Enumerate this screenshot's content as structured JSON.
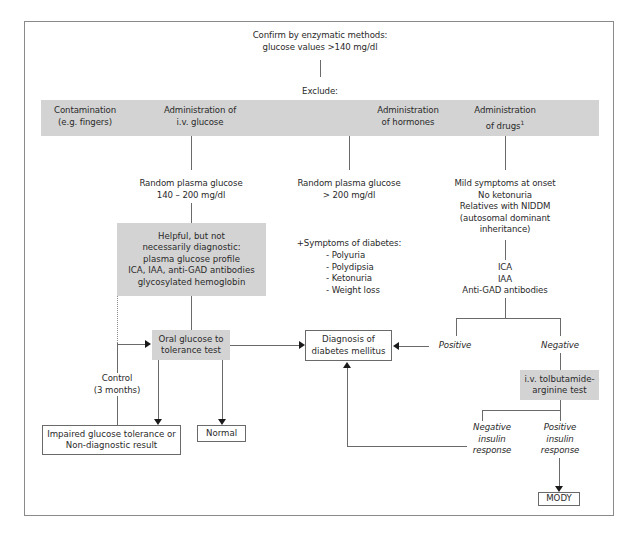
{
  "diagram": {
    "top": {
      "line1": "Confirm by enzymatic methods:",
      "line2": "glucose values >140 mg/dl",
      "exclude": "Exclude:"
    },
    "exclusions": [
      {
        "line1": "Contamination",
        "line2": "(e.g. fingers)"
      },
      {
        "line1": "Administration of",
        "line2": "i.v. glucose"
      },
      {
        "line1": "Administration",
        "line2": "of hormones"
      },
      {
        "line1": "Administration",
        "line2": "of drugs",
        "sup": "1"
      }
    ],
    "left_branch": {
      "random_glucose_line1": "Random plasma glucose",
      "random_glucose_line2": "140 – 200 mg/dl",
      "helpful_box": [
        "Helpful, but not",
        "necessarily diagnostic:",
        "plasma glucose profile",
        "ICA, IAA, anti-GAD antibodies",
        "glycosylated hemoglobin"
      ],
      "ogtt_line1": "Oral glucose to",
      "ogtt_line2": "tolerance test",
      "control_line1": "Control",
      "control_line2": "(3 months)",
      "impaired_line1": "Impaired glucose tolerance or",
      "impaired_line2": "Non-diagnostic result",
      "normal": "Normal"
    },
    "middle_branch": {
      "random_glucose_line1": "Random plasma glucose",
      "random_glucose_line2": "> 200 mg/dl",
      "symptoms_title": "+Symptoms of diabetes:",
      "symptoms": [
        "- Polyuria",
        "- Polydipsia",
        "- Ketonuria",
        "- Weight loss"
      ],
      "diagnosis_line1": "Diagnosis of",
      "diagnosis_line2": "diabetes mellitus"
    },
    "right_branch": {
      "criteria": [
        "Mild symptoms at onset",
        "No ketonuria",
        "Relatives with NIDDM",
        "(autosomal dominant",
        "inheritance)"
      ],
      "antibodies": [
        "ICA",
        "IAA",
        "Anti-GAD antibodies"
      ],
      "positive": "Positive",
      "negative": "Negative",
      "tolbutamide_line1": "i.v. tolbutamide-",
      "tolbutamide_line2": "arginine test",
      "neg_insulin": [
        "Negative",
        "insulin",
        "response"
      ],
      "pos_insulin": [
        "Positive",
        "insulin",
        "response"
      ],
      "mody": "MODY"
    }
  },
  "colors": {
    "box_fill": "#d3d3d3",
    "line": "#6a6a6a",
    "frame": "#8a8a8a",
    "text": "#2a2a2a"
  }
}
